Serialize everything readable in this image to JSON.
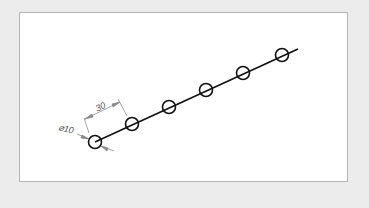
{
  "drawing": {
    "colors": {
      "background": "#ececec",
      "sheet": "#ffffff",
      "sheet_border": "#b5b5b5",
      "geometry": "#111111",
      "dimension": "#8a8a8a",
      "dimension_text": "#555555"
    },
    "centerline": {
      "x1": 95,
      "y1": 142,
      "x2": 298,
      "y2": 49
    },
    "holes": {
      "count": 6,
      "radius_px": 6.5,
      "centers": [
        {
          "x": 95,
          "y": 142
        },
        {
          "x": 132,
          "y": 124
        },
        {
          "x": 169,
          "y": 107
        },
        {
          "x": 206,
          "y": 90
        },
        {
          "x": 243,
          "y": 73
        },
        {
          "x": 282,
          "y": 55
        }
      ]
    },
    "dimensions": {
      "spacing": {
        "label": "30",
        "value": 30
      },
      "diameter": {
        "label": "⌀10",
        "value": 10
      }
    }
  }
}
